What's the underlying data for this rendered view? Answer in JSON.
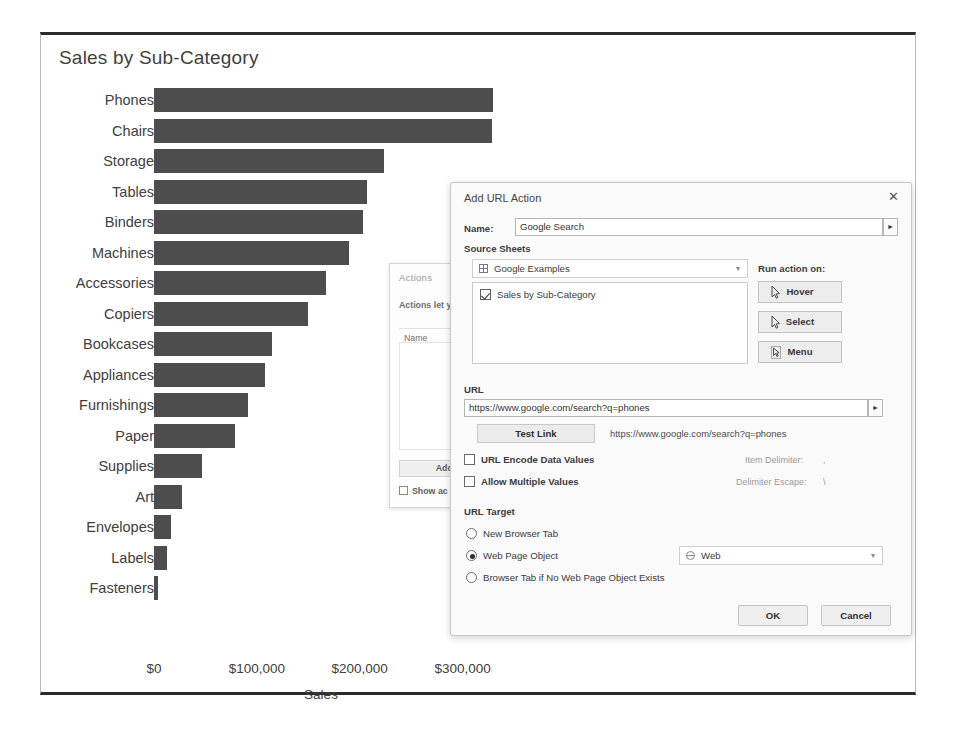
{
  "dashboard": {
    "title": "Sales by Sub-Category"
  },
  "chart_data": {
    "type": "bar",
    "orientation": "horizontal",
    "title": "Sales by Sub-Category",
    "xlabel": "Sales",
    "ylabel": "",
    "xlim": [
      0,
      350000
    ],
    "xticks": [
      0,
      100000,
      200000,
      300000
    ],
    "xticklabels": [
      "$0",
      "$100,000",
      "$200,000",
      "$300,000"
    ],
    "grid": false,
    "legend": null,
    "bar_color": "#4d4d4d",
    "categories": [
      "Phones",
      "Chairs",
      "Storage",
      "Tables",
      "Binders",
      "Machines",
      "Accessories",
      "Copiers",
      "Bookcases",
      "Appliances",
      "Furnishings",
      "Paper",
      "Supplies",
      "Art",
      "Envelopes",
      "Labels",
      "Fasteners"
    ],
    "values": [
      330007,
      328449,
      223844,
      206966,
      203413,
      189239,
      167380,
      149528,
      114880,
      107532,
      91705,
      78479,
      46674,
      27119,
      16476,
      12486,
      3024
    ]
  },
  "actions_dialog": {
    "title": "Actions",
    "description": "Actions let y\nthe web.",
    "list_header": "Name",
    "add_action_label": "Add Action",
    "show_checkbox_label": "Show ac"
  },
  "url_dialog": {
    "title": "Add URL Action",
    "close_icon": "close-icon",
    "name_label": "Name:",
    "name_value": "Google Search",
    "name_arrow_glyph": "►",
    "source_sheets_label": "Source Sheets",
    "workbook_value": "Google Examples",
    "workbook_icon": "grid-icon",
    "sheet_items": [
      {
        "label": "Sales by Sub-Category",
        "checked": true
      }
    ],
    "run_action_label": "Run action on:",
    "run_action_buttons": [
      {
        "label": "Hover",
        "icon": "cursor-hover-icon"
      },
      {
        "label": "Select",
        "icon": "cursor-select-icon"
      },
      {
        "label": "Menu",
        "icon": "cursor-menu-icon"
      }
    ],
    "url_label": "URL",
    "url_value": "https://www.google.com/search?q=phones",
    "url_arrow_glyph": "►",
    "test_link_label": "Test Link",
    "test_link_url": "https://www.google.com/search?q=phones",
    "checkboxes": [
      {
        "label": "URL Encode Data Values",
        "checked": false
      },
      {
        "label": "Allow Multiple Values",
        "checked": false
      }
    ],
    "item_delimiter_label": "Item Delimiter:",
    "item_delimiter_value": ",",
    "delimiter_escape_label": "Delimiter Escape:",
    "delimiter_escape_value": "\\",
    "url_target_label": "URL Target",
    "url_target_options": [
      {
        "label": "New Browser Tab",
        "selected": false
      },
      {
        "label": "Web Page Object",
        "selected": true
      },
      {
        "label": "Browser Tab if No Web Page Object Exists",
        "selected": false
      }
    ],
    "web_object_value": "Web",
    "web_object_icon": "globe-icon",
    "ok_label": "OK",
    "cancel_label": "Cancel"
  }
}
